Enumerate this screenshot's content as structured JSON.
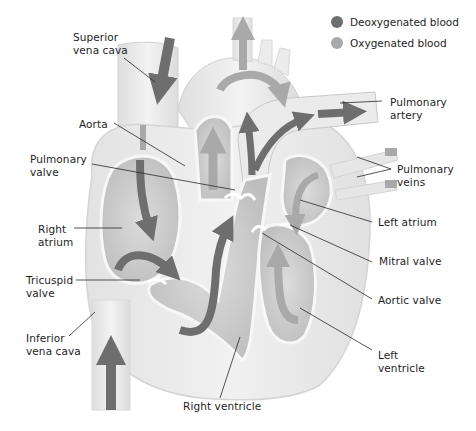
{
  "legend": {
    "items": [
      {
        "label": "Deoxygenated blood",
        "color": "#6e6e6e"
      },
      {
        "label": "Oxygenated blood",
        "color": "#a9a9a9"
      }
    ]
  },
  "labels": {
    "superior_vena_cava": "Superior\nvena cava",
    "aorta": "Aorta",
    "pulmonary_valve": "Pulmonary\nvalve",
    "right_atrium": "Right\natrium",
    "tricuspid_valve": "Tricuspid\nvalve",
    "inferior_vena_cava": "Inferior\nvena cava",
    "right_ventricle": "Right ventricle",
    "pulmonary_artery": "Pulmonary\nartery",
    "pulmonary_veins": "Pulmonary\nveins",
    "left_atrium": "Left atrium",
    "mitral_valve": "Mitral valve",
    "aortic_valve": "Aortic valve",
    "left_ventricle": "Left\nventricle"
  },
  "colors": {
    "deoxygenated": "#6e6e6e",
    "oxygenated": "#a9a9a9",
    "tissue_light": "#ececec",
    "tissue_mid": "#d6d6d6",
    "chamber": "#c9c9c9",
    "leader_line": "#2a2a2a"
  }
}
